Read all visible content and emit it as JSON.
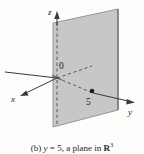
{
  "figure": {
    "kind": "3d-coordinate-plane-diagram",
    "background_color": "#fdfdfc",
    "plane": {
      "fill_color": "#c2c2c2",
      "edge_color": "#8a8a8a",
      "equation": "y = 5",
      "corners": [
        [
          53,
          23
        ],
        [
          118,
          9
        ],
        [
          118,
          110
        ],
        [
          53,
          127
        ]
      ]
    },
    "axes": {
      "line_color": "#3a3a3a",
      "z": {
        "label": "z",
        "direction": "up"
      },
      "x": {
        "label": "x",
        "direction": "down-left"
      },
      "y": {
        "label": "y",
        "direction": "right"
      }
    },
    "origin": {
      "label": "0"
    },
    "marked_point": {
      "label": "5",
      "dot_color": "#1b1b1b",
      "on_axis": "y"
    },
    "dashed_lines": {
      "color": "#4a4a4a",
      "items": [
        "z-axis-hidden-segment",
        "x-axis-hidden-segment",
        "y-axis-hidden-segment"
      ]
    }
  },
  "caption": {
    "part_label": "(b)",
    "equation_lhs": "y",
    "equation_eq": "=",
    "equation_rhs": "5,",
    "description": "a plane in",
    "space_symbol": "R",
    "space_exponent": "3",
    "full_text": "(b) y = 5, a plane in R3"
  }
}
